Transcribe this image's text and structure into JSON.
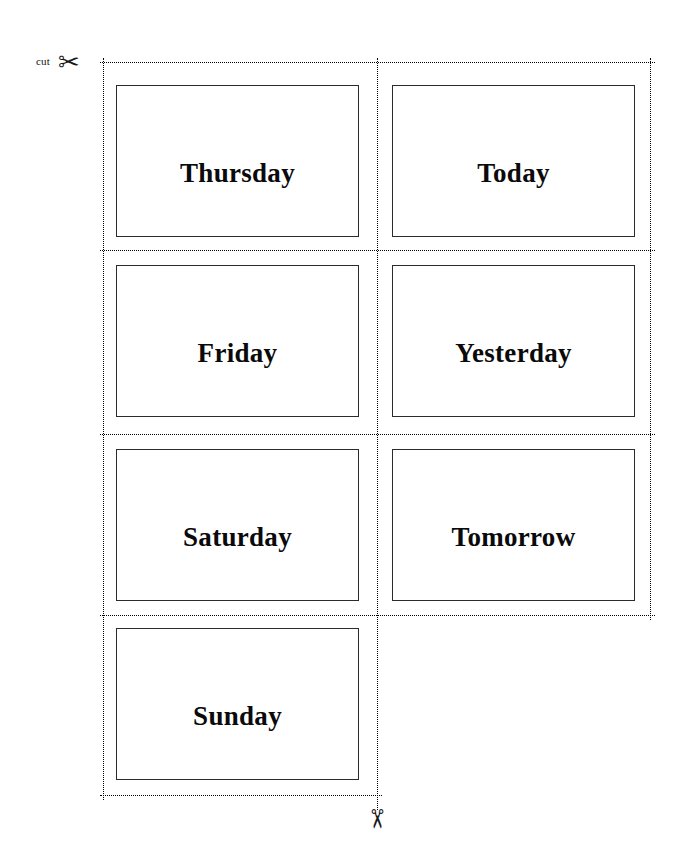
{
  "page": {
    "background_color": "#ffffff",
    "width": 688,
    "height": 863
  },
  "cut_guides": {
    "label": "cut",
    "line_color": "#000000",
    "style": "dotted",
    "top_scissors_icon": "scissors-right",
    "top_scissors_glyph": "✂",
    "bottom_scissors_icon": "scissors-down",
    "bottom_scissors_glyph": "✂"
  },
  "cards": {
    "border_color": "#2b2b2b",
    "text_color": "#0a0a0a",
    "items": [
      {
        "label": "Thursday",
        "row": 1,
        "column": 1
      },
      {
        "label": "Today",
        "row": 1,
        "column": 2
      },
      {
        "label": "Friday",
        "row": 2,
        "column": 1
      },
      {
        "label": "Yesterday",
        "row": 2,
        "column": 2
      },
      {
        "label": "Saturday",
        "row": 3,
        "column": 1
      },
      {
        "label": "Tomorrow",
        "row": 3,
        "column": 2
      },
      {
        "label": "Sunday",
        "row": 4,
        "column": 1
      }
    ]
  }
}
